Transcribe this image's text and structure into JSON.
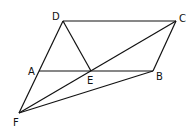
{
  "diagram": {
    "points": [
      {
        "id": "D",
        "label": "D"
      },
      {
        "id": "C",
        "label": "C"
      },
      {
        "id": "A",
        "label": "A"
      },
      {
        "id": "E",
        "label": "E"
      },
      {
        "id": "B",
        "label": "B"
      },
      {
        "id": "F",
        "label": "F"
      }
    ],
    "segments": [
      [
        "D",
        "C"
      ],
      [
        "D",
        "F"
      ],
      [
        "D",
        "E"
      ],
      [
        "C",
        "B"
      ],
      [
        "A",
        "B"
      ],
      [
        "C",
        "F"
      ],
      [
        "B",
        "F"
      ]
    ]
  }
}
